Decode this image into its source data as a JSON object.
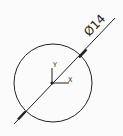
{
  "drawing": {
    "background": "#fbfbfb",
    "stroke_color": "#222222",
    "circle": {
      "cx": 53,
      "cy": 83,
      "r": 39
    },
    "dimension": {
      "label": "Ø14",
      "line": {
        "x1": 14,
        "y1": 124,
        "x2": 115,
        "y2": 18
      },
      "angle_deg": -46
    },
    "axes": {
      "origin": {
        "x": 52,
        "y": 83
      },
      "x_label": "X",
      "y_label": "Y"
    }
  }
}
